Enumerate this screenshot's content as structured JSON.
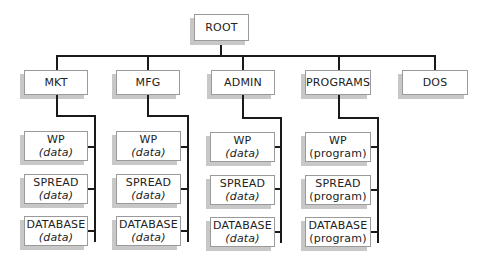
{
  "diagram": {
    "type": "tree",
    "root": {
      "label": "ROOT"
    },
    "children": [
      {
        "label": "MKT",
        "files": [
          {
            "name": "WP",
            "kind": "(data)"
          },
          {
            "name": "SPREAD",
            "kind": "(data)"
          },
          {
            "name": "DATABASE",
            "kind": "(data)"
          }
        ]
      },
      {
        "label": "MFG",
        "files": [
          {
            "name": "WP",
            "kind": "(data)"
          },
          {
            "name": "SPREAD",
            "kind": "(data)"
          },
          {
            "name": "DATABASE",
            "kind": "(data)"
          }
        ]
      },
      {
        "label": "ADMIN",
        "files": [
          {
            "name": "WP",
            "kind": "(data)"
          },
          {
            "name": "SPREAD",
            "kind": "(data)"
          },
          {
            "name": "DATABASE",
            "kind": "(data)"
          }
        ]
      },
      {
        "label": "PROGRAMS",
        "files": [
          {
            "name": "WP",
            "kind": "(program)"
          },
          {
            "name": "SPREAD",
            "kind": "(program)"
          },
          {
            "name": "DATABASE",
            "kind": "(program)"
          }
        ]
      },
      {
        "label": "DOS",
        "files": []
      }
    ]
  },
  "colors": {
    "line": "#1a1a1a",
    "box_border": "#9a9a9a",
    "shadow": "#c8c8c8",
    "background": "#ffffff"
  }
}
